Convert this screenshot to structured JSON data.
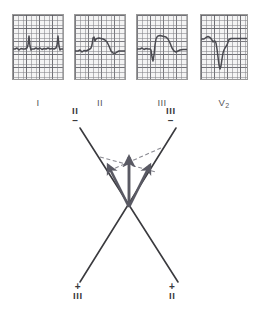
{
  "figure": {
    "type": "ecg-with-vector-diagram",
    "background_color": "#ffffff",
    "trace_color": "#4a4a50",
    "grid_color": "#82828a",
    "axis_color": "#3a3a3e",
    "arrow_color": "#5a5a64"
  },
  "ecg_panel": {
    "strips": [
      {
        "label": "I",
        "label_sub": "",
        "description": "Lead I: small low-amplitude complexes with two tall narrow R waves",
        "box": {
          "x": 12,
          "y": 14,
          "w": 52,
          "h": 66
        },
        "baseline_y": 34,
        "waveform": "M0,34 L2,34 L4,33 L6,35 L8,33.5 L10,34 L12,34 L14,33 L15,30 L16,21 L17,31 L18,35 L19,34 L21,34 L23,33 L25,34 L27,33 L29,34.5 L31,33.5 L33,34 L35,33 L37,34 L39,33.5 L41,34 L43,33 L44,30 L45,21 L46,31 L47,35 L48,34 L50,34 L52,34"
      },
      {
        "label": "II",
        "label_sub": "",
        "description": "Lead II: marked ST-segment elevation with broad coved plateau",
        "box": {
          "x": 74,
          "y": 14,
          "w": 52,
          "h": 66
        },
        "baseline_y": 36,
        "waveform": "M0,36 L3,36 L5,35 L7,37 L9,35.5 L11,36 L13,35 L15,34 L16,33 L17,30 L18,23 L19,22 L20,26 L21,24 L22,23.5 L24,23 L26,23.5 L28,24 L30,25 L32,27 L34,31 L36,36 L38,38 L40,38.5 L42,37 L44,36 L47,36 L50,36 L52,36"
      },
      {
        "label": "III",
        "label_sub": "",
        "description": "Lead III: Q wave then marked ST-segment elevation plateau",
        "box": {
          "x": 136,
          "y": 14,
          "w": 52,
          "h": 66
        },
        "baseline_y": 34,
        "waveform": "M0,34 L3,34 L5,33 L7,34.5 L9,33.5 L11,34 L13,34 L14,35 L15,42 L16,46 L17,40 L18,30 L19,24 L20,22 L21,21 L23,20.5 L25,21 L27,21.5 L29,22 L31,24 L33,28 L35,33 L37,36 L39,37 L41,36 L43,35 L46,34.5 L49,34.5 L52,34.5"
      },
      {
        "label": "V",
        "label_sub": "2",
        "description": "Lead V2: deep QS complex with reciprocal depression",
        "box": {
          "x": 200,
          "y": 14,
          "w": 48,
          "h": 66
        },
        "baseline_y": 24,
        "waveform": "M0,24 L3,24 L5,22.5 L7,21.5 L9,22.5 L11,25 L12,27 L13,26 L14,26 L15,28 L16,34 L17,42 L18,50 L19,54 L20,51 L21,44 L22,38 L23,35 L24,33 L25,31.5 L26,30 L28,24.5 L30,23.5 L33,23.5 L36,23.5 L40,23.5 L44,23.5 L48,23.5"
      }
    ]
  },
  "vector_diagram": {
    "description": "Crossed lead II and lead III axes with mean QRS vector arrows resolved by dashed construction lines",
    "axes": [
      {
        "name": "lead-II-axis",
        "negative_label": "II",
        "negative_sign": "–",
        "positive_label": "II",
        "positive_sign": "+",
        "from": {
          "x": 80,
          "y": 28
        },
        "to": {
          "x": 178,
          "y": 182
        }
      },
      {
        "name": "lead-III-axis",
        "negative_label": "III",
        "negative_sign": "–",
        "positive_label": "III",
        "positive_sign": "+",
        "from": {
          "x": 176,
          "y": 28
        },
        "to": {
          "x": 80,
          "y": 182
        }
      }
    ],
    "origin": {
      "x": 129,
      "y": 107
    },
    "arrows": [
      {
        "name": "lead-II-component-vector",
        "from": {
          "x": 129,
          "y": 107
        },
        "to": {
          "x": 108,
          "y": 65
        }
      },
      {
        "name": "mean-qrs-resultant-vector",
        "from": {
          "x": 129,
          "y": 107
        },
        "to": {
          "x": 129,
          "y": 57
        }
      },
      {
        "name": "lead-III-component-vector",
        "from": {
          "x": 129,
          "y": 107
        },
        "to": {
          "x": 150,
          "y": 65
        }
      }
    ],
    "construction_lines": [
      {
        "name": "dashed-parallel-to-lead-III",
        "from": {
          "x": 100,
          "y": 57
        },
        "to": {
          "x": 156,
          "y": 72
        }
      },
      {
        "name": "dashed-parallel-to-lead-II",
        "from": {
          "x": 161,
          "y": 48
        },
        "to": {
          "x": 111,
          "y": 70
        }
      }
    ],
    "labels": {
      "top_left": {
        "text": "II",
        "sign": "–",
        "x": 72,
        "y": 6
      },
      "top_right": {
        "text": "III",
        "sign": "–",
        "x": 166,
        "y": 6
      },
      "bottom_left": {
        "text": "III",
        "sign": "+",
        "x": 73,
        "y": 182
      },
      "bottom_right": {
        "text": "II",
        "sign": "+",
        "x": 169,
        "y": 182
      }
    }
  }
}
